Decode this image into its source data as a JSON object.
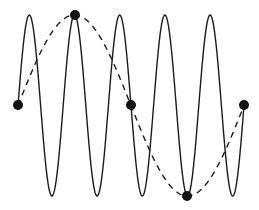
{
  "diagram": {
    "colors": {
      "line": "#1a1a1a",
      "point": "#111111",
      "background": "#ffffff"
    },
    "solid_wave": {
      "x_start": 18,
      "x_end": 244,
      "midline_y": 105.5,
      "amplitude": 90.5,
      "period": 45.2,
      "phase_start_x": 18
    },
    "dashed_wave": {
      "x_start": 18,
      "x_end": 244,
      "midline_y": 105.5,
      "amplitude": 90.5,
      "period": 226,
      "phase_start_x": 18
    },
    "sample_points": [
      {
        "x": 18,
        "y": 105
      },
      {
        "x": 75,
        "y": 15
      },
      {
        "x": 131,
        "y": 105
      },
      {
        "x": 187,
        "y": 196
      },
      {
        "x": 244,
        "y": 105
      }
    ]
  }
}
